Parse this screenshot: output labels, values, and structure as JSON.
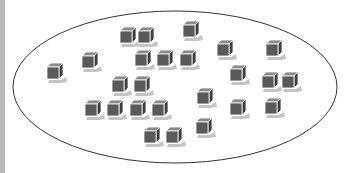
{
  "diagram": {
    "ellipse": {
      "cx": 175,
      "cy": 87,
      "rx": 162,
      "ry": 76,
      "stroke": "#333333"
    },
    "colors": {
      "front": "#5a5a5a",
      "top": "#8a8a8a",
      "side": "#3e3e3e",
      "outline": "#ffffff",
      "shadow": "#c4c4c4",
      "strip": "#b9b9b9"
    },
    "cube_size": 12,
    "cubes": [
      {
        "x": 120,
        "y": 31
      },
      {
        "x": 138,
        "y": 31
      },
      {
        "x": 183,
        "y": 25
      },
      {
        "x": 47,
        "y": 67
      },
      {
        "x": 82,
        "y": 56
      },
      {
        "x": 135,
        "y": 54
      },
      {
        "x": 157,
        "y": 54
      },
      {
        "x": 180,
        "y": 54
      },
      {
        "x": 217,
        "y": 44
      },
      {
        "x": 266,
        "y": 44
      },
      {
        "x": 230,
        "y": 69
      },
      {
        "x": 262,
        "y": 76
      },
      {
        "x": 282,
        "y": 76
      },
      {
        "x": 112,
        "y": 80
      },
      {
        "x": 134,
        "y": 80
      },
      {
        "x": 85,
        "y": 104
      },
      {
        "x": 107,
        "y": 104
      },
      {
        "x": 130,
        "y": 104
      },
      {
        "x": 152,
        "y": 104
      },
      {
        "x": 197,
        "y": 92
      },
      {
        "x": 230,
        "y": 103
      },
      {
        "x": 265,
        "y": 102
      },
      {
        "x": 196,
        "y": 122
      },
      {
        "x": 144,
        "y": 131
      },
      {
        "x": 166,
        "y": 131
      }
    ],
    "cube_count": 25
  }
}
